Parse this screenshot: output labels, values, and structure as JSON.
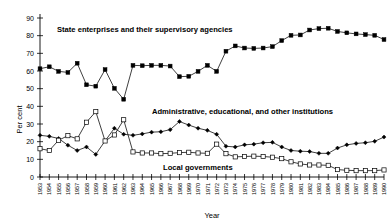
{
  "chart_data": {
    "type": "line",
    "title": "",
    "xlabel": "Year",
    "ylabel": "Per cent",
    "ylim": [
      0,
      90
    ],
    "yticks": [
      0,
      10,
      20,
      30,
      40,
      50,
      60,
      70,
      80,
      90
    ],
    "grid": false,
    "legend_position": "inline-annotations",
    "x": [
      1953,
      1954,
      1955,
      1956,
      1957,
      1958,
      1959,
      1960,
      1961,
      1962,
      1963,
      1964,
      1965,
      1966,
      1967,
      1968,
      1969,
      1970,
      1971,
      1972,
      1973,
      1974,
      1975,
      1976,
      1977,
      1978,
      1979,
      1980,
      1981,
      1982,
      1983,
      1984,
      1985,
      1986,
      1987,
      1988,
      1989,
      1990
    ],
    "categories": [
      "1953",
      "1954",
      "1955",
      "1956",
      "1957",
      "1958",
      "1959",
      "1960",
      "1961",
      "1962",
      "1963",
      "1964",
      "1965",
      "1966",
      "1967",
      "1968",
      "1969",
      "1970",
      "1971",
      "1972",
      "1973",
      "1974",
      "1975",
      "1976",
      "1977",
      "1978",
      "1979",
      "1980",
      "1981",
      "1982",
      "1983",
      "1984",
      "1985",
      "1986",
      "1987",
      "1988",
      "1989",
      "1990"
    ],
    "series": [
      {
        "name": "State enterprises and their supervisory agencies",
        "marker": "filled-square",
        "values": [
          61.3,
          62.4,
          59.8,
          59.2,
          64.4,
          52.2,
          51.4,
          60.8,
          50.2,
          44.0,
          63.2,
          63.0,
          63.2,
          63.2,
          62.8,
          56.8,
          57.0,
          59.8,
          63.2,
          59.8,
          71.2,
          74.2,
          73.0,
          72.8,
          73.0,
          73.8,
          77.2,
          80.2,
          80.4,
          83.2,
          84.0,
          84.2,
          82.4,
          81.6,
          81.0,
          80.6,
          80.2,
          77.8
        ]
      },
      {
        "name": "Administrative, educational, and other institutions",
        "marker": "filled-diamond",
        "values": [
          23.6,
          23.0,
          21.8,
          18.0,
          15.0,
          17.0,
          12.8,
          20.4,
          27.6,
          24.2,
          23.6,
          24.4,
          25.4,
          25.6,
          26.8,
          31.4,
          29.4,
          27.6,
          26.4,
          24.2,
          17.4,
          17.0,
          18.2,
          18.6,
          19.4,
          19.6,
          17.0,
          15.0,
          14.6,
          14.4,
          13.4,
          13.4,
          16.4,
          18.2,
          19.0,
          19.4,
          20.2,
          22.6
        ]
      },
      {
        "name": "Local governments",
        "marker": "open-square",
        "values": [
          16.0,
          15.0,
          20.8,
          23.4,
          21.6,
          31.0,
          37.0,
          20.4,
          23.8,
          32.4,
          14.2,
          13.6,
          13.6,
          13.2,
          13.4,
          13.8,
          14.0,
          13.6,
          13.4,
          18.6,
          13.2,
          11.4,
          11.6,
          11.8,
          11.6,
          11.2,
          10.4,
          8.6,
          7.4,
          6.8,
          6.8,
          6.6,
          4.2,
          3.8,
          3.6,
          3.6,
          3.6,
          4.0
        ]
      }
    ],
    "annotations": [
      {
        "text": "State enterprises and their supervisory agencies",
        "x_px": 57,
        "y_px": 32
      },
      {
        "text": "Administrative, educational, and other institutions",
        "x_px": 152,
        "y_px": 114
      },
      {
        "text": "Local governments",
        "x_px": 163,
        "y_px": 170
      }
    ]
  }
}
